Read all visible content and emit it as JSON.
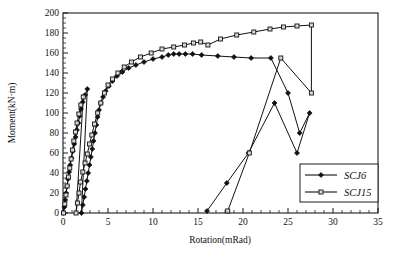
{
  "chart_data": {
    "type": "line",
    "title": "",
    "xlabel": "Rotation(mRad)",
    "ylabel": "Moment(kN·m)",
    "xlim": [
      0,
      35
    ],
    "ylim": [
      0,
      200
    ],
    "x_major_step": 5,
    "x_minor_step": 1,
    "y_major_step": 20,
    "y_minor_step": 5,
    "x_ticks": [
      "0",
      "5",
      "10",
      "15",
      "20",
      "25",
      "30",
      "35"
    ],
    "y_ticks": [
      "0",
      "20",
      "40",
      "60",
      "80",
      "100",
      "120",
      "140",
      "160",
      "180",
      "200"
    ],
    "grid": false,
    "legend_position": "lower-right",
    "series": [
      {
        "name": "SCJ6",
        "marker": "filled-diamond",
        "color": "#111111",
        "points": [
          [
            0.05,
            0
          ],
          [
            0.15,
            6
          ],
          [
            0.25,
            13
          ],
          [
            0.35,
            20
          ],
          [
            0.45,
            27
          ],
          [
            0.55,
            34
          ],
          [
            0.68,
            41
          ],
          [
            0.8,
            48
          ],
          [
            0.95,
            55
          ],
          [
            1.1,
            62
          ],
          [
            1.25,
            69
          ],
          [
            1.4,
            76
          ],
          [
            1.55,
            83
          ],
          [
            1.7,
            90
          ],
          [
            1.85,
            97
          ],
          [
            2.0,
            104
          ],
          [
            2.2,
            111
          ],
          [
            2.45,
            118
          ],
          [
            2.7,
            124
          ],
          [
            2.05,
            0
          ],
          [
            2.2,
            8
          ],
          [
            2.35,
            16
          ],
          [
            2.5,
            24
          ],
          [
            2.65,
            32
          ],
          [
            2.8,
            40
          ],
          [
            2.95,
            48
          ],
          [
            3.1,
            56
          ],
          [
            3.25,
            64
          ],
          [
            3.4,
            72
          ],
          [
            3.55,
            80
          ],
          [
            3.7,
            88
          ],
          [
            3.85,
            96
          ],
          [
            4.0,
            103
          ],
          [
            4.2,
            110
          ],
          [
            4.45,
            116
          ],
          [
            4.75,
            122
          ],
          [
            5.1,
            127
          ],
          [
            5.5,
            132
          ],
          [
            6.0,
            137
          ],
          [
            6.6,
            141
          ],
          [
            7.3,
            145
          ],
          [
            8.1,
            148
          ],
          [
            9.0,
            151
          ],
          [
            10.0,
            154
          ],
          [
            11.0,
            156
          ],
          [
            11.7,
            158
          ],
          [
            12.3,
            159
          ],
          [
            12.9,
            159
          ],
          [
            13.6,
            159
          ],
          [
            14.4,
            159
          ],
          [
            15.4,
            158
          ],
          [
            17.2,
            157
          ],
          [
            19.0,
            156
          ],
          [
            20.9,
            155
          ],
          [
            23.1,
            155
          ],
          [
            25.0,
            120
          ],
          [
            26.3,
            80
          ],
          [
            27.4,
            100
          ],
          [
            26.0,
            60
          ],
          [
            23.5,
            110
          ],
          [
            20.6,
            60
          ],
          [
            18.2,
            30
          ],
          [
            16.0,
            2
          ]
        ]
      },
      {
        "name": "SCJ15",
        "marker": "open-square",
        "color": "#111111",
        "points": [
          [
            0.05,
            0
          ],
          [
            0.2,
            9
          ],
          [
            0.33,
            18
          ],
          [
            0.46,
            27
          ],
          [
            0.6,
            36
          ],
          [
            0.75,
            45
          ],
          [
            0.9,
            54
          ],
          [
            1.05,
            63
          ],
          [
            1.2,
            72
          ],
          [
            1.38,
            81
          ],
          [
            1.56,
            90
          ],
          [
            1.76,
            99
          ],
          [
            1.98,
            108
          ],
          [
            2.25,
            116
          ],
          [
            1.45,
            0
          ],
          [
            1.6,
            10
          ],
          [
            1.78,
            20
          ],
          [
            1.95,
            31
          ],
          [
            2.2,
            41
          ],
          [
            2.45,
            50
          ],
          [
            2.7,
            59
          ],
          [
            2.95,
            69
          ],
          [
            3.2,
            78
          ],
          [
            3.5,
            89
          ],
          [
            3.85,
            100
          ],
          [
            4.2,
            110
          ],
          [
            4.6,
            120
          ],
          [
            5.0,
            128
          ],
          [
            5.5,
            134
          ],
          [
            6.1,
            140
          ],
          [
            6.8,
            146
          ],
          [
            7.6,
            151
          ],
          [
            8.6,
            156
          ],
          [
            9.8,
            160
          ],
          [
            11.0,
            164
          ],
          [
            12.3,
            166
          ],
          [
            13.5,
            168
          ],
          [
            14.5,
            170
          ],
          [
            15.3,
            171
          ],
          [
            16.1,
            168
          ],
          [
            17.5,
            174
          ],
          [
            19.3,
            178
          ],
          [
            21.2,
            181
          ],
          [
            23.0,
            184
          ],
          [
            24.5,
            186
          ],
          [
            26.0,
            187
          ],
          [
            27.6,
            188
          ],
          [
            27.6,
            120
          ],
          [
            24.2,
            155
          ],
          [
            20.7,
            60
          ],
          [
            18.3,
            2
          ]
        ]
      }
    ]
  },
  "legend": {
    "entries": [
      {
        "label": "SCJ6",
        "marker": "filled-diamond"
      },
      {
        "label": "SCJ15",
        "marker": "open-square"
      }
    ]
  }
}
